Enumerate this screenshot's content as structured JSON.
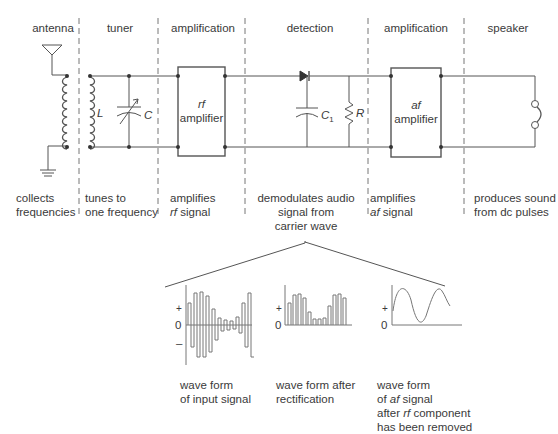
{
  "stages": [
    {
      "id": "antenna",
      "title": "antenna",
      "description": [
        "collects",
        "frequencies"
      ]
    },
    {
      "id": "tuner",
      "title": "tuner",
      "description": [
        "tunes to",
        "one frequency"
      ]
    },
    {
      "id": "rf-amplification",
      "title": "amplification",
      "description_parts": [
        {
          "text": "amplifies"
        },
        {
          "italic": "rf",
          "text": " signal"
        }
      ]
    },
    {
      "id": "detection",
      "title": "detection",
      "description": [
        "demodulates audio",
        "signal from",
        "carrier wave"
      ]
    },
    {
      "id": "af-amplification",
      "title": "amplification",
      "description_parts": [
        {
          "text": "amplifies"
        },
        {
          "italic": "af",
          "text": " signal"
        }
      ]
    },
    {
      "id": "speaker",
      "title": "speaker",
      "description": [
        "produces sound",
        "from dc pulses"
      ]
    }
  ],
  "components": {
    "inductor": "L",
    "capacitor": "C",
    "detector_capacitor": "C",
    "detector_capacitor_sub": "1",
    "resistor": "R",
    "rf_amp": {
      "prefix": "rf",
      "label": "amplifier"
    },
    "af_amp": {
      "prefix": "af",
      "label": "amplifier"
    }
  },
  "waveforms": [
    {
      "id": "input",
      "axis": {
        "plus": "+",
        "zero": "0",
        "minus": "–"
      },
      "caption": [
        "wave form",
        "of input signal"
      ]
    },
    {
      "id": "rectified",
      "axis": {
        "plus": "+",
        "zero": "0"
      },
      "caption": [
        "wave form after",
        "rectification"
      ]
    },
    {
      "id": "af",
      "axis": {
        "plus": "+",
        "zero": "0"
      },
      "caption_parts": [
        {
          "text": "wave form"
        },
        {
          "text": "of ",
          "italic": "af",
          "after": " signal"
        },
        {
          "text": "after ",
          "italic": "rf",
          "after": " component"
        },
        {
          "text": "has been removed"
        }
      ]
    }
  ]
}
